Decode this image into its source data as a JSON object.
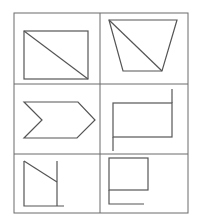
{
  "diagram": {
    "title": "",
    "layout": "3 rows x 2 columns grid of line figures",
    "line_color": "#555555",
    "grid_color": "#6a6a6a",
    "background": "#ffffff",
    "cells": [
      {
        "row": 1,
        "col": 1,
        "description": "rectangle with diagonal from top-left to bottom-right"
      },
      {
        "row": 1,
        "col": 2,
        "description": "inverted trapezoid with diagonal from top-left to bottom-right"
      },
      {
        "row": 2,
        "col": 1,
        "description": "chevron arrow pointing right"
      },
      {
        "row": 2,
        "col": 2,
        "description": "rectangle with right side extended upward and left side extended downward"
      },
      {
        "row": 3,
        "col": 1,
        "description": "right trapezoid open figure with slanted top edge and extended baseline"
      },
      {
        "row": 3,
        "col": 2,
        "description": "rectangle with left side extended downward and bottom line"
      }
    ]
  }
}
